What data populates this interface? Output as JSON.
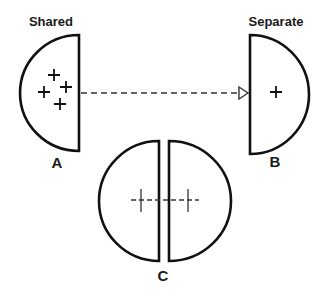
{
  "diagram": {
    "labels": {
      "shared": "Shared",
      "separate": "Separate",
      "a": "A",
      "b": "B",
      "c": "C"
    },
    "panels": [
      {
        "id": "A",
        "title": "Shared",
        "shape": "left-facing half-disc",
        "markers": 4
      },
      {
        "id": "B",
        "title": "Separate",
        "shape": "right-facing half-disc",
        "markers": 1
      },
      {
        "id": "C",
        "title": "",
        "shape": "two half-discs split",
        "markers": 2
      }
    ],
    "connectors": [
      {
        "from": "A",
        "to": "B",
        "style": "dashed",
        "head": "open-triangle"
      },
      {
        "from": "C-left",
        "to": "C-right",
        "style": "dashed",
        "head": "none"
      }
    ],
    "colors": {
      "stroke": "#111111",
      "background": "#ffffff"
    }
  }
}
